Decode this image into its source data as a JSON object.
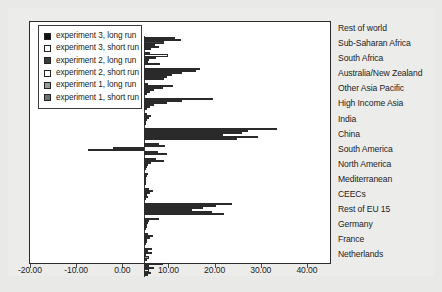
{
  "chart_data": {
    "type": "bar",
    "orientation": "horizontal",
    "title": "",
    "xlabel": "",
    "ylabel": "",
    "xlim": [
      -20.0,
      45.0
    ],
    "grid": false,
    "legend_position": "top-left inside plot area",
    "xticks": [
      -20.0,
      -10.0,
      0.0,
      10.0,
      20.0,
      30.0,
      40.0
    ],
    "xtick_labels": [
      "-20.00",
      "-10.00",
      "0.00",
      "10.00",
      "20.00",
      "30.00",
      "40.00"
    ],
    "categories": [
      "Rest of world",
      "Sub-Saharan Africa",
      "South Africa",
      "Australia/New Zealand",
      "Other Asia Pacific",
      "High Income Asia",
      "India",
      "China",
      "South America",
      "North America",
      "Mediterranean",
      "CEECs",
      "Rest of EU 15",
      "Germany",
      "France",
      "Netherlands"
    ],
    "series": [
      {
        "name": "experiment 3, long run",
        "color": "#111111",
        "values": [
          6.6,
          1.2,
          12.0,
          0.8,
          14.9,
          0.5,
          28.8,
          3.1,
          2.6,
          0.9,
          1.1,
          19.0,
          3.2,
          0.8,
          1.6,
          4.1
        ]
      },
      {
        "name": "experiment 3, short run",
        "color": "#ffffff",
        "values": [
          8.0,
          5.1,
          11.2,
          6.2,
          8.2,
          1.5,
          22.5,
          4.4,
          4.2,
          0.6,
          1.8,
          15.5,
          1.0,
          1.9,
          0.7,
          1.0
        ]
      },
      {
        "name": "experiment 2, long run",
        "color": "#3b3b3b",
        "values": [
          4.2,
          2.6,
          8.1,
          4.1,
          5.0,
          1.0,
          21.2,
          -6.8,
          1.4,
          0.4,
          1.2,
          12.8,
          0.9,
          1.3,
          1.7,
          2.2
        ]
      },
      {
        "name": "experiment 2, short run",
        "color": "#ffffff",
        "values": [
          2.3,
          1.0,
          6.0,
          2.0,
          2.1,
          0.5,
          17.1,
          -12.2,
          0.8,
          0.2,
          0.5,
          10.4,
          0.5,
          0.6,
          0.4,
          1.1
        ]
      },
      {
        "name": "experiment 1, long run",
        "color": "#9a9a9a",
        "values": [
          3.1,
          0.9,
          5.0,
          1.2,
          1.2,
          0.4,
          24.7,
          2.9,
          0.6,
          0.3,
          0.7,
          14.6,
          0.6,
          0.5,
          1.0,
          1.4
        ]
      },
      {
        "name": "experiment 1, short run",
        "color": "#6f6f6f",
        "values": [
          1.5,
          3.3,
          4.2,
          0.6,
          0.6,
          0.3,
          20.1,
          4.9,
          0.4,
          0.2,
          0.3,
          17.3,
          0.3,
          0.3,
          0.5,
          0.8
        ]
      }
    ]
  },
  "legend": {
    "items": [
      {
        "label": "experiment 3, long run",
        "swatch": "#111111"
      },
      {
        "label": "experiment 3, short run",
        "swatch": "#ffffff"
      },
      {
        "label": "experiment 2, long run",
        "swatch": "#3b3b3b"
      },
      {
        "label": "experiment 2, short run",
        "swatch": "#ffffff"
      },
      {
        "label": "experiment 1, long run",
        "swatch": "#9a9a9a"
      },
      {
        "label": "experiment 1, short run",
        "swatch": "#6f6f6f"
      }
    ]
  },
  "colors": {
    "page_background": "#e9e9e7",
    "panel_background": "#ececeb",
    "plot_background": "#ffffff",
    "frame": "#2c2c2c",
    "axis_text": "#1d1d1d"
  }
}
